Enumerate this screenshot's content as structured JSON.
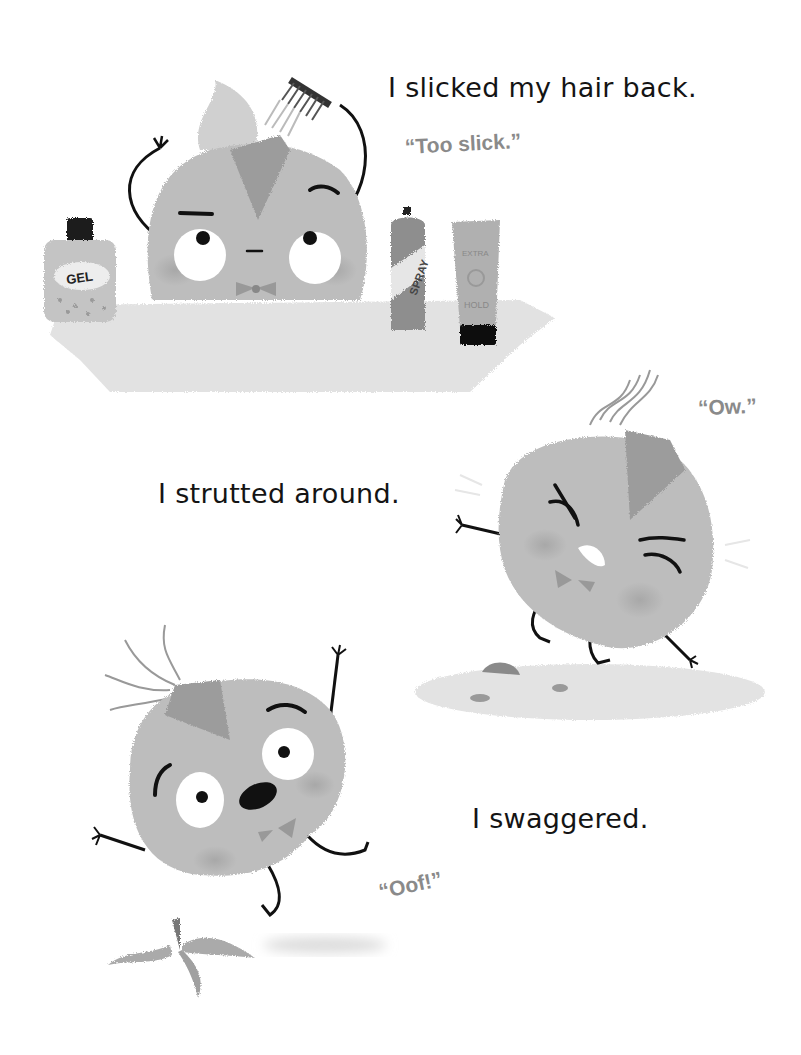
{
  "page": {
    "background": "#ffffff",
    "ink_color": "#141414",
    "speech_color": "#8a8a8a"
  },
  "scenes": [
    {
      "id": "slick",
      "narration": "I slicked my hair back.",
      "speech": "“Too slick.”",
      "props": {
        "gel_label": "GEL",
        "spray_label": "SPRAY",
        "tube_label_top": "EXTRA",
        "tube_label_bottom": "HOLD"
      }
    },
    {
      "id": "strut",
      "narration": "I strutted around.",
      "speech": "“Ow.”"
    },
    {
      "id": "swagger",
      "narration": "I swaggered.",
      "speech": "“Oof!”"
    }
  ]
}
